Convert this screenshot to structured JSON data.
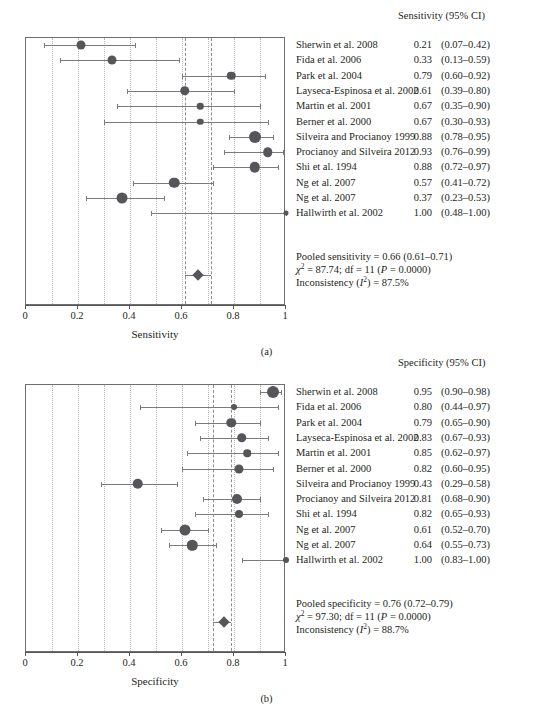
{
  "figure": {
    "type": "forest-plot-pair",
    "caption_a": "(a)",
    "caption_b": "(b)"
  },
  "chart_data": [
    {
      "type": "scatter",
      "subtype": "forest-plot",
      "panel": "a",
      "title": "Sensitivity (95% CI)",
      "xlabel": "Sensitivity",
      "ylabel": "",
      "xlim": [
        0,
        1
      ],
      "xticks": [
        0,
        0.2,
        0.4,
        0.6,
        0.8,
        1
      ],
      "xticklabels": [
        "0",
        "0.2",
        "0.4",
        "0.6",
        "0.8",
        "1"
      ],
      "gridlines": [
        0.1,
        0.2,
        0.3,
        0.4,
        0.5,
        0.6,
        0.7,
        0.8,
        0.9
      ],
      "grid": true,
      "reference_lines": [
        0.61,
        0.71
      ],
      "legend": "",
      "categories": [
        "Sherwin et al. 2008",
        "Fida et al. 2006",
        "Park et al. 2004",
        "Layseca-Espinosa et al. 2002",
        "Martin et al. 2001",
        "Berner et al. 2000",
        "Silveira and Procianoy 1999",
        "Procianoy and Silveira 2012",
        "Shi et al. 1994",
        "Ng et al. 2007",
        "Ng et al. 2007",
        "Hallwirth et al. 2002"
      ],
      "values": [
        0.21,
        0.33,
        0.79,
        0.61,
        0.67,
        0.67,
        0.88,
        0.93,
        0.88,
        0.57,
        0.37,
        1.0
      ],
      "ci_low": [
        0.07,
        0.13,
        0.6,
        0.39,
        0.35,
        0.3,
        0.78,
        0.76,
        0.72,
        0.41,
        0.23,
        0.48
      ],
      "ci_high": [
        0.42,
        0.59,
        0.92,
        0.8,
        0.9,
        0.93,
        0.95,
        0.99,
        0.97,
        0.72,
        0.53,
        1.0
      ],
      "weights": [
        9,
        9,
        8.5,
        9.5,
        6.5,
        6.5,
        12,
        9.5,
        10.5,
        10.5,
        11,
        5
      ],
      "pooled": {
        "estimate": 0.66,
        "ci_low": 0.61,
        "ci_high": 0.71
      }
    },
    {
      "type": "scatter",
      "subtype": "forest-plot",
      "panel": "b",
      "title": "Specificity (95% CI)",
      "xlabel": "Specificity",
      "ylabel": "",
      "xlim": [
        0,
        1
      ],
      "xticks": [
        0,
        0.2,
        0.4,
        0.6,
        0.8,
        1
      ],
      "xticklabels": [
        "0",
        "0.2",
        "0.4",
        "0.6",
        "0.8",
        "1"
      ],
      "gridlines": [
        0.1,
        0.2,
        0.3,
        0.4,
        0.5,
        0.6,
        0.7,
        0.8,
        0.9
      ],
      "grid": true,
      "reference_lines": [
        0.72,
        0.79
      ],
      "legend": "",
      "categories": [
        "Sherwin et al. 2008",
        "Fida et al. 2006",
        "Park et al. 2004",
        "Layseca-Espinosa et al. 2002",
        "Martin et al. 2001",
        "Berner et al. 2000",
        "Silveira and Procianoy 1999",
        "Procianoy and Silveira 2012",
        "Shi et al. 1994",
        "Ng et al. 2007",
        "Ng et al. 2007",
        "Hallwirth et al. 2002"
      ],
      "values": [
        0.95,
        0.8,
        0.79,
        0.83,
        0.85,
        0.82,
        0.43,
        0.81,
        0.82,
        0.61,
        0.64,
        1.0
      ],
      "ci_low": [
        0.9,
        0.44,
        0.65,
        0.67,
        0.62,
        0.6,
        0.29,
        0.68,
        0.65,
        0.52,
        0.55,
        0.83
      ],
      "ci_high": [
        0.98,
        0.97,
        0.9,
        0.93,
        0.97,
        0.95,
        0.58,
        0.9,
        0.93,
        0.7,
        0.73,
        1.0
      ],
      "weights": [
        12,
        6,
        9.5,
        9.5,
        7.5,
        9,
        10.5,
        10,
        8,
        11,
        10.5,
        6
      ],
      "pooled": {
        "estimate": 0.76,
        "ci_low": 0.72,
        "ci_high": 0.79
      }
    }
  ],
  "panel_a": {
    "header": {
      "metric": "Sensitivity (95% CI)"
    },
    "rows": [
      {
        "study": "Sherwin et al. 2008",
        "est": "0.21",
        "ci": "(0.07–0.42)"
      },
      {
        "study": "Fida et al. 2006",
        "est": "0.33",
        "ci": "(0.13–0.59)"
      },
      {
        "study": "Park et al. 2004",
        "est": "0.79",
        "ci": "(0.60–0.92)"
      },
      {
        "study": "Layseca-Espinosa et al. 2002",
        "est": "0.61",
        "ci": "(0.39–0.80)"
      },
      {
        "study": "Martin et al. 2001",
        "est": "0.67",
        "ci": "(0.35–0.90)"
      },
      {
        "study": "Berner et al. 2000",
        "est": "0.67",
        "ci": "(0.30–0.93)"
      },
      {
        "study": "Silveira and Procianoy 1999",
        "est": "0.88",
        "ci": "(0.78–0.95)"
      },
      {
        "study": "Procianoy and Silveira 2012",
        "est": "0.93",
        "ci": "(0.76–0.99)"
      },
      {
        "study": "Shi et al. 1994",
        "est": "0.88",
        "ci": "(0.72–0.97)"
      },
      {
        "study": "Ng et al. 2007",
        "est": "0.57",
        "ci": "(0.41–0.72)"
      },
      {
        "study": "Ng et al. 2007",
        "est": "0.37",
        "ci": "(0.23–0.53)"
      },
      {
        "study": "Hallwirth et al. 2002",
        "est": "1.00",
        "ci": "(0.48–1.00)"
      }
    ],
    "summary": {
      "pooled": "Pooled sensitivity = 0.66 (0.61–0.71)",
      "chi_value": " = 87.74; df = 11 (",
      "chi_symbol": "χ",
      "p_italic": "P",
      "p_value": " = 0.0000)",
      "inconsistency_pre": "Inconsistency (",
      "inconsistency_i": "I",
      "inconsistency_post": ") = 87.5%"
    },
    "axis": {
      "title": "Sensitivity",
      "ticks": [
        "0",
        "0.2",
        "0.4",
        "0.6",
        "0.8",
        "1"
      ]
    },
    "caption": "(a)"
  },
  "panel_b": {
    "header": {
      "metric": "Specificity (95% CI)"
    },
    "rows": [
      {
        "study": "Sherwin et al. 2008",
        "est": "0.95",
        "ci": "(0.90–0.98)"
      },
      {
        "study": "Fida et al. 2006",
        "est": "0.80",
        "ci": "(0.44–0.97)"
      },
      {
        "study": "Park et al. 2004",
        "est": "0.79",
        "ci": "(0.65–0.90)"
      },
      {
        "study": "Layseca-Espinosa et al. 2002",
        "est": "0.83",
        "ci": "(0.67–0.93)"
      },
      {
        "study": "Martin et al. 2001",
        "est": "0.85",
        "ci": "(0.62–0.97)"
      },
      {
        "study": "Berner et al. 2000",
        "est": "0.82",
        "ci": "(0.60–0.95)"
      },
      {
        "study": "Silveira and Procianoy 1999",
        "est": "0.43",
        "ci": "(0.29–0.58)"
      },
      {
        "study": "Procianoy and Silveira 2012",
        "est": "0.81",
        "ci": "(0.68–0.90)"
      },
      {
        "study": "Shi et al. 1994",
        "est": "0.82",
        "ci": "(0.65–0.93)"
      },
      {
        "study": "Ng et al. 2007",
        "est": "0.61",
        "ci": "(0.52–0.70)"
      },
      {
        "study": "Ng et al. 2007",
        "est": "0.64",
        "ci": "(0.55–0.73)"
      },
      {
        "study": "Hallwirth et al. 2002",
        "est": "1.00",
        "ci": "(0.83–1.00)"
      }
    ],
    "summary": {
      "pooled": "Pooled specificity = 0.76 (0.72–0.79)",
      "chi_value": " = 97.30; df = 11 (",
      "chi_symbol": "χ",
      "p_italic": "P",
      "p_value": " = 0.0000)",
      "inconsistency_pre": "Inconsistency (",
      "inconsistency_i": "I",
      "inconsistency_post": ") = 88.7%"
    },
    "axis": {
      "title": "Specificity",
      "ticks": [
        "0",
        "0.2",
        "0.4",
        "0.6",
        "0.8",
        "1"
      ]
    },
    "caption": "(b)"
  }
}
